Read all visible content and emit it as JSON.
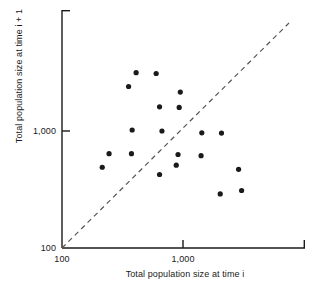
{
  "chart_data": {
    "type": "scatter",
    "title": "",
    "xlabel": "Total population size at time i",
    "ylabel": "Total population size at time i + 1",
    "ylabel_line1": "Total population size at",
    "ylabel_line2": "time i + 1",
    "xscale": "log",
    "yscale": "log",
    "xlim": [
      100,
      5200
    ],
    "ylim": [
      100,
      5800
    ],
    "xticks": [
      100,
      1000
    ],
    "xtick_labels": [
      "100",
      "1,000"
    ],
    "yticks": [
      100,
      1000
    ],
    "ytick_labels": [
      "100",
      "1,000"
    ],
    "grid": false,
    "legend": "none",
    "marker": "filled-circle",
    "marker_color": "#1a1a1a",
    "marker_size_px": 4,
    "reference_line": {
      "label": "y = x (1:1 diagonal)",
      "style": "dashed",
      "color": "#555555",
      "from": [
        100,
        100
      ],
      "to": [
        5000,
        5000
      ]
    },
    "points": [
      {
        "x": 410,
        "y": 3150
      },
      {
        "x": 600,
        "y": 3100
      },
      {
        "x": 355,
        "y": 2400
      },
      {
        "x": 950,
        "y": 2150
      },
      {
        "x": 640,
        "y": 1610
      },
      {
        "x": 930,
        "y": 1590
      },
      {
        "x": 380,
        "y": 1020
      },
      {
        "x": 670,
        "y": 1000
      },
      {
        "x": 1430,
        "y": 965
      },
      {
        "x": 2080,
        "y": 960
      },
      {
        "x": 245,
        "y": 640
      },
      {
        "x": 375,
        "y": 640
      },
      {
        "x": 910,
        "y": 630
      },
      {
        "x": 1410,
        "y": 615
      },
      {
        "x": 880,
        "y": 510
      },
      {
        "x": 215,
        "y": 490
      },
      {
        "x": 2880,
        "y": 470
      },
      {
        "x": 640,
        "y": 425
      },
      {
        "x": 3050,
        "y": 310
      },
      {
        "x": 2030,
        "y": 290
      }
    ],
    "n_points": 20
  },
  "axes": {
    "x_axis_name": "x-axis",
    "y_axis_name": "y-axis"
  }
}
